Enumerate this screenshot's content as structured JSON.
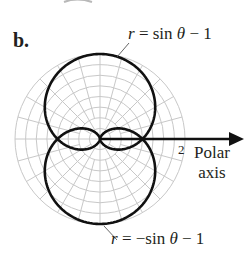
{
  "panel": {
    "label": "b."
  },
  "chart_data": {
    "type": "line",
    "coordinate_system": "polar",
    "title": "",
    "series": [
      {
        "name": "r = sin θ − 1",
        "equation": "r = sin(theta) - 1",
        "theta_range": [
          0,
          6.2832
        ],
        "samples": [
          {
            "theta_deg": 0,
            "r": -1
          },
          {
            "theta_deg": 90,
            "r": 0
          },
          {
            "theta_deg": 180,
            "r": -1
          },
          {
            "theta_deg": 270,
            "r": -2
          }
        ],
        "color": "#111111"
      },
      {
        "name": "r = −sin θ − 1",
        "equation": "r = -sin(theta) - 1",
        "theta_range": [
          0,
          6.2832
        ],
        "samples": [
          {
            "theta_deg": 0,
            "r": -1
          },
          {
            "theta_deg": 90,
            "r": -2
          },
          {
            "theta_deg": 180,
            "r": -1
          },
          {
            "theta_deg": 270,
            "r": 0
          }
        ],
        "color": "#111111"
      }
    ],
    "grid": {
      "on": true,
      "max_radius": 2,
      "ring_step": 0.25,
      "spoke_step_deg": 15,
      "color": "#c8c8c8"
    },
    "axis": {
      "name_line1": "Polar",
      "name_line2": "axis",
      "tick_label": "2"
    },
    "annotations": [
      {
        "text": "r = sin θ − 1",
        "points_to": "top of upper curve"
      },
      {
        "text": "r = −sin θ − 1",
        "points_to": "bottom of lower curve"
      }
    ]
  },
  "labels": {
    "eq_top_r": "r",
    "eq_top_rest": " = sin ",
    "eq_top_theta": "θ",
    "eq_top_tail": " − 1",
    "eq_bottom_r": "r",
    "eq_bottom_rest": " = −sin ",
    "eq_bottom_theta": "θ",
    "eq_bottom_tail": " − 1",
    "tick": "2",
    "axis_line1": "Polar",
    "axis_line2": "axis"
  }
}
